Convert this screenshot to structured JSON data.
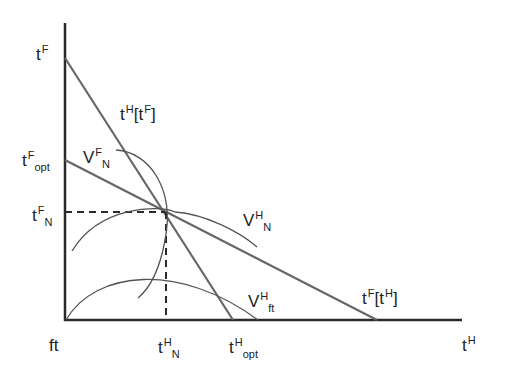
{
  "diagram": {
    "type": "reaction-function diagram",
    "axes": {
      "y_label": {
        "base": "t",
        "sup": "F"
      },
      "x_label": {
        "base": "t",
        "sup": "H"
      },
      "origin_label": "ft"
    },
    "y_ticks": [
      {
        "base": "t",
        "sup": "F",
        "sub": ""
      },
      {
        "base": "t",
        "sup": "F",
        "sub": "opt"
      },
      {
        "base": "t",
        "sup": "F",
        "sub": "N"
      }
    ],
    "x_ticks": [
      {
        "base": "t",
        "sup": "H",
        "sub": "N"
      },
      {
        "base": "t",
        "sup": "H",
        "sub": "opt"
      }
    ],
    "curves": {
      "reaction_H": {
        "label": "tH[tF]",
        "base": "t",
        "sup": "H",
        "bracket": "[t",
        "bracket_sup": "F",
        "close": "]"
      },
      "reaction_F": {
        "label": "tF[tH]",
        "base": "t",
        "sup": "F",
        "bracket": "[t",
        "bracket_sup": "H",
        "close": "]"
      },
      "iso_F_N": {
        "base": "V",
        "sup": "F",
        "sub": "N"
      },
      "iso_H_N": {
        "base": "V",
        "sup": "H",
        "sub": "N"
      },
      "iso_H_ft": {
        "base": "V",
        "sup": "H",
        "sub": "ft"
      }
    },
    "colors": {
      "axis": "#2a2a2a",
      "line": "#666666",
      "curve": "#555555",
      "dash": "#2a2a2a"
    }
  }
}
